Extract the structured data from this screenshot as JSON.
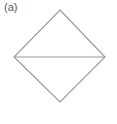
{
  "figure": {
    "label": "(a)",
    "stroke_color": "#9a9a9a",
    "shape": "square rotated 45 degrees (diamond) bisected by horizontal diagonal",
    "vertices": {
      "top": [
        60,
        10
      ],
      "right": [
        105,
        57
      ],
      "bottom": [
        60,
        102
      ],
      "left": [
        14,
        57
      ]
    }
  }
}
